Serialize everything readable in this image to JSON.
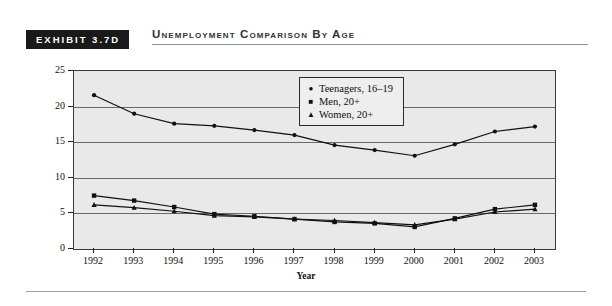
{
  "header": {
    "exhibit_tag": "EXHIBIT 3.7D",
    "title": "Unemployment Comparison by Age"
  },
  "legend": {
    "position": "inside-top-center",
    "items": [
      {
        "marker": "circle-marker",
        "glyph": "●",
        "label": "Teenagers, 16–19"
      },
      {
        "marker": "square-marker",
        "glyph": "■",
        "label": "Men, 20+"
      },
      {
        "marker": "triangle-marker",
        "glyph": "▲",
        "label": "Women, 20+"
      }
    ]
  },
  "chart_data": {
    "type": "line",
    "title": "Unemployment Comparison by Age",
    "xlabel": "Year",
    "ylabel": "Percent",
    "x": [
      1992,
      1993,
      1994,
      1995,
      1996,
      1997,
      1998,
      1999,
      2000,
      2001,
      2002,
      2003
    ],
    "categories": [
      "1992",
      "1993",
      "1994",
      "1995",
      "1996",
      "1997",
      "1998",
      "1999",
      "2000",
      "2001",
      "2002",
      "2003"
    ],
    "xlim": [
      1991.5,
      2003.5
    ],
    "ylim": [
      0,
      25
    ],
    "yticks": [
      0,
      5,
      10,
      15,
      20,
      25
    ],
    "xticks": [
      "1992",
      "1993",
      "1994",
      "1995",
      "1996",
      "1997",
      "1998",
      "1999",
      "2000",
      "2001",
      "2002",
      "2003"
    ],
    "grid": true,
    "legend_position": "inside-top-center",
    "series": [
      {
        "name": "Teenagers, 16–19",
        "marker": "circle",
        "values": [
          21.6,
          19.0,
          17.6,
          17.3,
          16.7,
          16.0,
          14.6,
          13.9,
          13.1,
          14.7,
          16.5,
          17.2
        ]
      },
      {
        "name": "Men, 20+",
        "marker": "square",
        "values": [
          7.5,
          6.8,
          5.9,
          4.9,
          4.6,
          4.2,
          3.8,
          3.6,
          3.1,
          4.3,
          5.6,
          6.2
        ]
      },
      {
        "name": "Women, 20+",
        "marker": "triangle",
        "values": [
          6.2,
          5.8,
          5.3,
          4.7,
          4.5,
          4.2,
          4.0,
          3.7,
          3.4,
          4.2,
          5.2,
          5.6
        ]
      }
    ]
  }
}
